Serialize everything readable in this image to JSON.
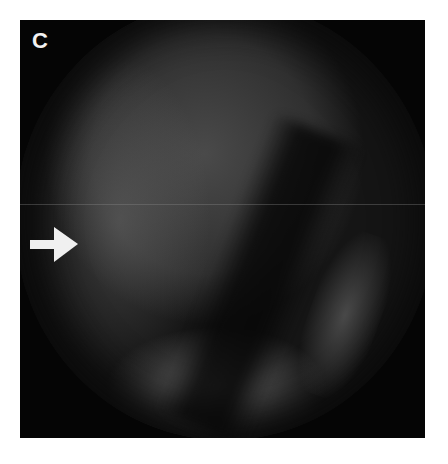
{
  "figure": {
    "panel_label": "C",
    "arrow": {
      "direction": "right",
      "color": "#f0f0f0"
    },
    "colors": {
      "background": "#ffffff",
      "frame": "#050505",
      "tissue": "#4a4a4a"
    }
  }
}
